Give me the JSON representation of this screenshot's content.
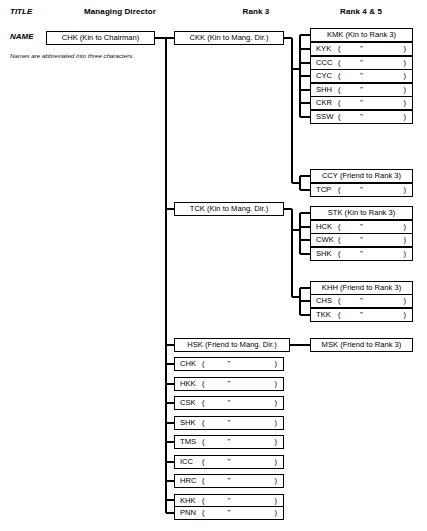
{
  "meta": {
    "note": "Names are abbreviated into three characters.",
    "ditto_mark": "\"",
    "open_paren": "(",
    "close_paren": ")"
  },
  "row_labels": {
    "title": "TITLE",
    "name": "NAME"
  },
  "columns": [
    {
      "id": "managing-director",
      "label": "Managing Director"
    },
    {
      "id": "rank-3",
      "label": "Rank 3"
    },
    {
      "id": "rank-4-5",
      "label": "Rank 4 & 5"
    }
  ],
  "root": {
    "id": "chk-root",
    "name": "CHK",
    "relation": "Kin to Chairman",
    "label": "CHK (Kin to Chairman)"
  },
  "rank3": [
    {
      "id": "ckk",
      "name": "CKK",
      "relation": "Kin to Mang. Dir.",
      "label": "CKK (Kin to Mang. Dir.)",
      "ditto": false
    },
    {
      "id": "tck",
      "name": "TCK",
      "relation": "Kin to Mang. Dir.",
      "label": "TCK (Kin to Mang. Dir.)",
      "ditto": false
    },
    {
      "id": "hsk",
      "name": "HSK",
      "relation": "Friend to Mang. Dir.",
      "label": "HSK (Friend to Mang. Dir.)",
      "ditto": false
    },
    {
      "id": "chk",
      "name": "CHK",
      "ditto": true
    },
    {
      "id": "hkk",
      "name": "HKK",
      "ditto": true
    },
    {
      "id": "csk",
      "name": "CSK",
      "ditto": true
    },
    {
      "id": "shk3",
      "name": "SHK",
      "ditto": true
    },
    {
      "id": "tms",
      "name": "TMS",
      "ditto": true
    },
    {
      "id": "icc",
      "name": "ICC",
      "ditto": true
    },
    {
      "id": "hrc",
      "name": "HRC",
      "ditto": true
    },
    {
      "id": "khk",
      "name": "KHK",
      "ditto": true
    },
    {
      "id": "pnn",
      "name": "PNN",
      "ditto": true
    }
  ],
  "rank45_groups": [
    {
      "id": "group-kmk",
      "parent": "ckk",
      "head_relation": "Kin to Rank 3",
      "members": [
        {
          "id": "kmk",
          "name": "KMK",
          "relation": "Kin to Rank 3",
          "label": "KMK (Kin to Rank 3)",
          "ditto": false
        },
        {
          "id": "kyk",
          "name": "KYK",
          "ditto": true
        },
        {
          "id": "ccc",
          "name": "CCC",
          "ditto": true
        },
        {
          "id": "cyc",
          "name": "CYC",
          "ditto": true
        },
        {
          "id": "shh",
          "name": "SHH",
          "ditto": true
        },
        {
          "id": "ckr",
          "name": "CKR",
          "ditto": true
        },
        {
          "id": "ssw",
          "name": "SSW",
          "ditto": true
        }
      ]
    },
    {
      "id": "group-ccy",
      "parent": "ckk",
      "head_relation": "Friend to Rank 3",
      "members": [
        {
          "id": "ccy",
          "name": "CCY",
          "relation": "Friend to Rank 3",
          "label": "CCY (Friend to Rank 3)",
          "ditto": false
        },
        {
          "id": "tcp",
          "name": "TCP",
          "ditto": true
        }
      ]
    },
    {
      "id": "group-stk",
      "parent": "tck",
      "head_relation": "Kin to Rank 3",
      "members": [
        {
          "id": "stk",
          "name": "STK",
          "relation": "Kin to Rank 3",
          "label": "STK (Kin to Rank 3)",
          "ditto": false
        },
        {
          "id": "hck",
          "name": "HCK",
          "ditto": true
        },
        {
          "id": "cwk",
          "name": "CWK",
          "ditto": true
        },
        {
          "id": "shk45",
          "name": "SHK",
          "ditto": true
        }
      ]
    },
    {
      "id": "group-khh",
      "parent": "tck",
      "head_relation": "Friend to Rank 3",
      "members": [
        {
          "id": "khh",
          "name": "KHH",
          "relation": "Friend to Rank 3",
          "label": "KHH (Friend to Rank 3)",
          "ditto": false
        },
        {
          "id": "chs",
          "name": "CHS",
          "ditto": true
        },
        {
          "id": "tkk",
          "name": "TKK",
          "ditto": true
        }
      ]
    },
    {
      "id": "group-msk",
      "parent": "hsk",
      "head_relation": "Friend to Rank 3",
      "members": [
        {
          "id": "msk",
          "name": "MSK",
          "relation": "Friend to Rank 3",
          "label": "MSK (Friend to Rank 3)",
          "ditto": false
        }
      ]
    }
  ]
}
